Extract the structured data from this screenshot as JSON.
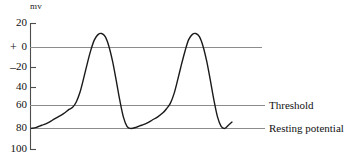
{
  "figure": {
    "axis_unit": "mv",
    "y_axis": {
      "tick_labels": [
        "20",
        "0",
        "20",
        "40",
        "60",
        "80",
        "100"
      ],
      "sign_positive": "+",
      "sign_negative": "–"
    },
    "annotations": {
      "threshold": "Threshold",
      "resting_potential": "Resting potential"
    },
    "colors": {
      "curve": "#1a1a1a",
      "axis": "#4d4d4d",
      "gridline": "#8c8c8c",
      "background": "#ffffff"
    }
  },
  "chart_data": {
    "type": "line",
    "title": "",
    "xlabel": "",
    "ylabel": "mv",
    "ylim": [
      -100,
      20
    ],
    "grid": true,
    "legend_position": "right-inline",
    "y_ticks": [
      20,
      0,
      -20,
      -40,
      -60,
      -80,
      -100
    ],
    "y_tick_labels": [
      "20",
      "0",
      "20",
      "40",
      "60",
      "80",
      "100"
    ],
    "reference_lines": [
      {
        "name": "Zero",
        "value": 0,
        "label": ""
      },
      {
        "name": "Threshold",
        "value": -60,
        "label": "Threshold"
      },
      {
        "name": "Resting potential",
        "value": -80,
        "label": "Resting potential"
      }
    ],
    "series": [
      {
        "name": "Membrane potential",
        "points": [
          [
            0,
            -80
          ],
          [
            6,
            -79
          ],
          [
            12,
            -77
          ],
          [
            18,
            -75
          ],
          [
            24,
            -72
          ],
          [
            30,
            -69
          ],
          [
            36,
            -66
          ],
          [
            42,
            -62
          ],
          [
            46,
            -60
          ],
          [
            50,
            -55
          ],
          [
            54,
            -46
          ],
          [
            58,
            -33
          ],
          [
            62,
            -19
          ],
          [
            66,
            -6
          ],
          [
            70,
            4
          ],
          [
            74,
            9
          ],
          [
            78,
            10
          ],
          [
            82,
            7
          ],
          [
            86,
            -2
          ],
          [
            90,
            -16
          ],
          [
            94,
            -34
          ],
          [
            98,
            -53
          ],
          [
            102,
            -69
          ],
          [
            106,
            -78
          ],
          [
            110,
            -80
          ],
          [
            116,
            -79
          ],
          [
            122,
            -77
          ],
          [
            128,
            -75
          ],
          [
            134,
            -72
          ],
          [
            140,
            -69
          ],
          [
            146,
            -65
          ],
          [
            150,
            -61
          ],
          [
            154,
            -56
          ],
          [
            158,
            -47
          ],
          [
            162,
            -34
          ],
          [
            166,
            -20
          ],
          [
            170,
            -7
          ],
          [
            174,
            4
          ],
          [
            178,
            9
          ],
          [
            182,
            10
          ],
          [
            186,
            7
          ],
          [
            190,
            -2
          ],
          [
            194,
            -16
          ],
          [
            198,
            -34
          ],
          [
            202,
            -53
          ],
          [
            206,
            -69
          ],
          [
            210,
            -78
          ],
          [
            214,
            -80
          ],
          [
            218,
            -77
          ],
          [
            222,
            -74
          ]
        ]
      }
    ]
  }
}
